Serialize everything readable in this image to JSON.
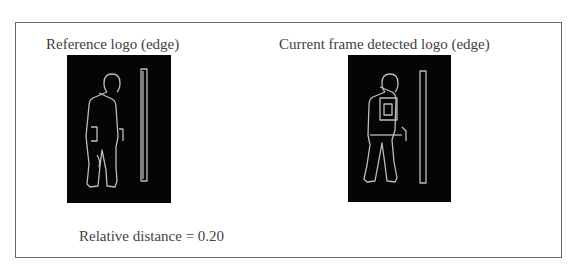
{
  "figure": {
    "left_panel": {
      "title": "Reference logo (edge)",
      "image": "edge-silhouette-person-with-pole"
    },
    "right_panel": {
      "title": "Current frame detected logo (edge)",
      "image": "edge-silhouette-person-with-pole-and-chest-box"
    },
    "result": {
      "text": "Relative distance = 0.20",
      "metric": "Relative distance",
      "value": 0.2
    },
    "colors": {
      "panel_bg": "#050505",
      "edge_line": "#bdbdbd",
      "border": "#6a6a6a",
      "text": "#3e3e3e"
    }
  }
}
